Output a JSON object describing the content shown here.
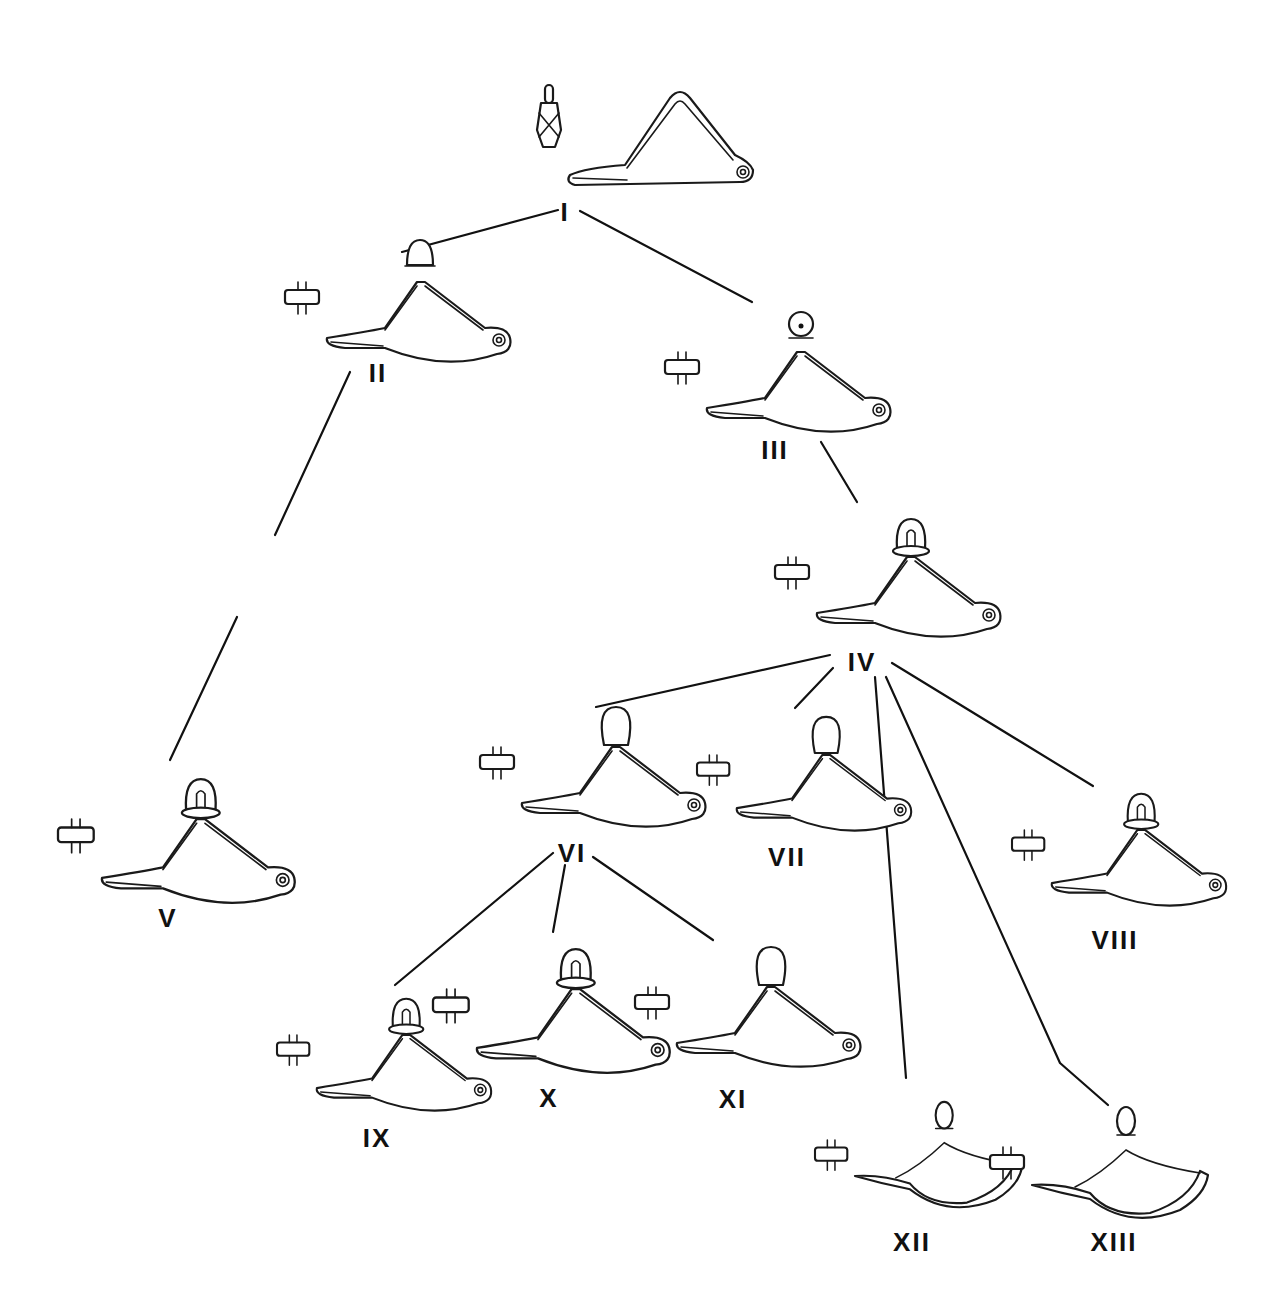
{
  "diagram": {
    "type": "typological-tree",
    "nodes": [
      {
        "id": "I",
        "label": "I",
        "label_x": 565,
        "label_y": 212,
        "fx": 520,
        "fy": 90,
        "scale": 1.0,
        "style": "triangular"
      },
      {
        "id": "II",
        "label": "II",
        "label_x": 378,
        "label_y": 373,
        "fx": 280,
        "fy": 240,
        "scale": 1.0,
        "style": "segmented-loop"
      },
      {
        "id": "III",
        "label": "III",
        "label_x": 775,
        "label_y": 450,
        "fx": 660,
        "fy": 310,
        "scale": 1.0,
        "style": "segmented-knob"
      },
      {
        "id": "IV",
        "label": "IV",
        "label_x": 862,
        "label_y": 662,
        "fx": 770,
        "fy": 515,
        "scale": 1.0,
        "style": "knob-spiral"
      },
      {
        "id": "V",
        "label": "V",
        "label_x": 168,
        "label_y": 918,
        "fx": 55,
        "fy": 775,
        "scale": 1.05,
        "style": "knob-spiral"
      },
      {
        "id": "VI",
        "label": "VI",
        "label_x": 572,
        "label_y": 853,
        "fx": 475,
        "fy": 705,
        "scale": 1.0,
        "style": "bulb"
      },
      {
        "id": "VII",
        "label": "VII",
        "label_x": 787,
        "label_y": 857,
        "fx": 690,
        "fy": 715,
        "scale": 0.95,
        "style": "bulb"
      },
      {
        "id": "VIII",
        "label": "VIII",
        "label_x": 1115,
        "label_y": 940,
        "fx": 1005,
        "fy": 790,
        "scale": 0.95,
        "style": "knob-spiral"
      },
      {
        "id": "IX",
        "label": "IX",
        "label_x": 377,
        "label_y": 1138,
        "fx": 270,
        "fy": 995,
        "scale": 0.95,
        "style": "knob-spiral"
      },
      {
        "id": "X",
        "label": "X",
        "label_x": 549,
        "label_y": 1098,
        "fx": 430,
        "fy": 945,
        "scale": 1.05,
        "style": "knob-spiral"
      },
      {
        "id": "XI",
        "label": "XI",
        "label_x": 733,
        "label_y": 1099,
        "fx": 630,
        "fy": 945,
        "scale": 1.0,
        "style": "bulb"
      },
      {
        "id": "XII",
        "label": "XII",
        "label_x": 912,
        "label_y": 1242,
        "fx": 808,
        "fy": 1100,
        "scale": 0.95,
        "style": "boat"
      },
      {
        "id": "XIII",
        "label": "XIII",
        "label_x": 1114,
        "label_y": 1242,
        "fx": 985,
        "fy": 1105,
        "scale": 1.0,
        "style": "boat"
      }
    ],
    "edges": [
      {
        "from": "I",
        "to": "II",
        "points": [
          [
            558,
            210
          ],
          [
            402,
            252
          ]
        ]
      },
      {
        "from": "I",
        "to": "III",
        "points": [
          [
            580,
            211
          ],
          [
            752,
            302
          ]
        ]
      },
      {
        "from": "II",
        "to": "V",
        "points": [
          [
            350,
            372
          ],
          [
            275,
            535
          ]
        ]
      },
      {
        "from": "II",
        "to": "V",
        "points": [
          [
            237,
            617
          ],
          [
            170,
            760
          ]
        ]
      },
      {
        "from": "III",
        "to": "IV",
        "points": [
          [
            821,
            442
          ],
          [
            857,
            502
          ]
        ]
      },
      {
        "from": "IV",
        "to": "VI",
        "points": [
          [
            830,
            655
          ],
          [
            596,
            707
          ]
        ]
      },
      {
        "from": "IV",
        "to": "VII",
        "points": [
          [
            833,
            668
          ],
          [
            795,
            708
          ]
        ]
      },
      {
        "from": "IV",
        "to": "XII",
        "points": [
          [
            875,
            677
          ],
          [
            906,
            1078
          ]
        ]
      },
      {
        "from": "IV",
        "to": "XIII",
        "points": [
          [
            886,
            677
          ],
          [
            1060,
            1063
          ],
          [
            1108,
            1105
          ]
        ]
      },
      {
        "from": "IV",
        "to": "VIII",
        "points": [
          [
            892,
            663
          ],
          [
            1093,
            786
          ]
        ]
      },
      {
        "from": "VI",
        "to": "IX",
        "points": [
          [
            553,
            853
          ],
          [
            395,
            985
          ]
        ]
      },
      {
        "from": "VI",
        "to": "X",
        "points": [
          [
            565,
            865
          ],
          [
            553,
            932
          ]
        ]
      },
      {
        "from": "VI",
        "to": "XI",
        "points": [
          [
            593,
            857
          ],
          [
            713,
            940
          ]
        ]
      }
    ]
  },
  "colors": {
    "background": "#ffffff",
    "ink": "#111111"
  }
}
